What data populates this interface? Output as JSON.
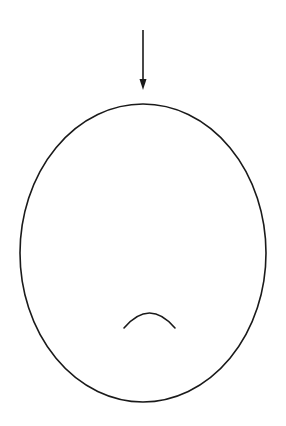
{
  "diagram": {
    "background": "#ffffff",
    "stroke_color": "#1a1a1a",
    "arrow": {
      "x": 143,
      "y_start": 30,
      "y_end": 90,
      "head_length": 11,
      "head_half_width": 3.5,
      "direction": "down"
    },
    "ellipse": {
      "cx": 143,
      "cy": 253,
      "rx": 123,
      "ry": 149
    },
    "arc": {
      "x_start": 124,
      "x_end": 175,
      "y_ends": 328,
      "y_top": 313,
      "shape": "frown"
    }
  }
}
